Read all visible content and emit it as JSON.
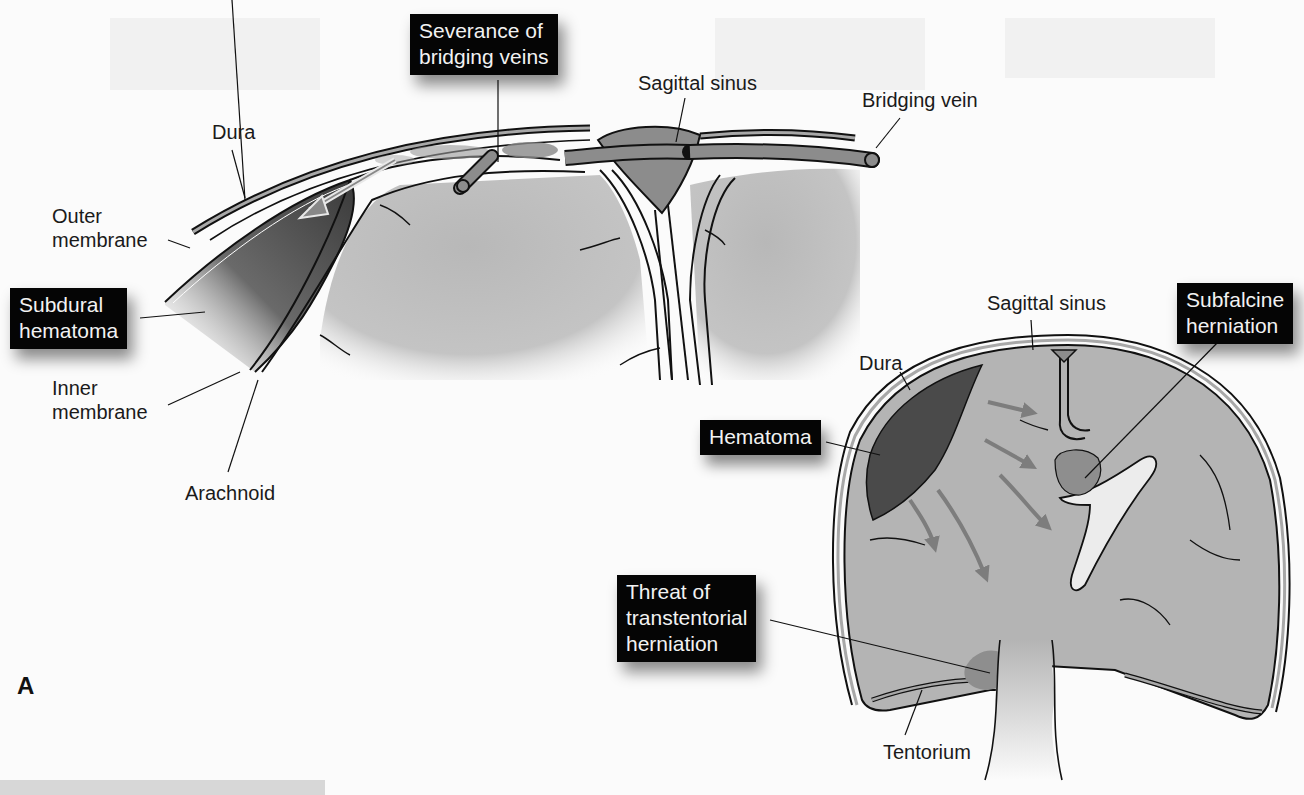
{
  "figure": {
    "panel_letter": "A",
    "colors": {
      "background": "#fbfbfb",
      "brain_tissue": "#b4b4b4",
      "sinus_vein": "#8c8c8c",
      "hematoma_dark": "#4a4a4a",
      "herniation": "#8e8e8e",
      "dura_fill": "#a8a8a8",
      "outline": "#111111",
      "callout_box": "#050505",
      "callout_text": "#f2f2f2",
      "arrow": "#7d7d7d"
    },
    "left_panel": {
      "title": "Subdural hematoma detail",
      "labels": {
        "dura": "Dura",
        "outer_membrane": "Outer\nmembrane",
        "inner_membrane": "Inner\nmembrane",
        "arachnoid": "Arachnoid",
        "sagittal_sinus": "Sagittal sinus",
        "bridging_vein": "Bridging vein"
      },
      "callouts": {
        "severance": "Severance of\nbridging veins",
        "subdural_hematoma": "Subdural\nhematoma"
      }
    },
    "right_panel": {
      "title": "Coronal section with herniation",
      "labels": {
        "sagittal_sinus": "Sagittal sinus",
        "dura": "Dura",
        "tentorium": "Tentorium"
      },
      "callouts": {
        "subfalcine": "Subfalcine\nherniation",
        "hematoma": "Hematoma",
        "transtentorial": "Threat of\ntranstentorial\nherniation"
      }
    }
  }
}
